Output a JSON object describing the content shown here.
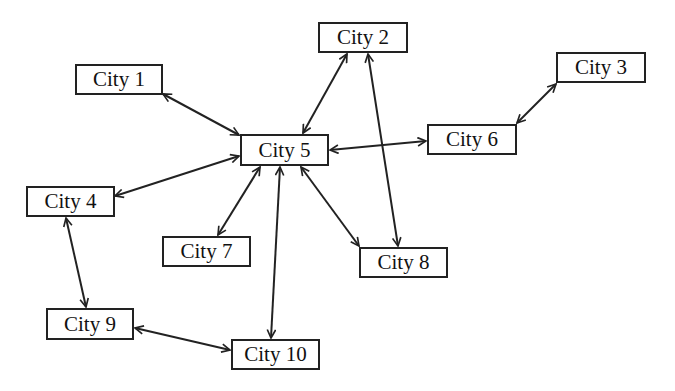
{
  "diagram": {
    "type": "network-graph",
    "nodes": [
      {
        "id": "c1",
        "label": "City 1",
        "x": 75,
        "y": 64,
        "w": 88,
        "h": 31
      },
      {
        "id": "c2",
        "label": "City 2",
        "x": 318,
        "y": 22,
        "w": 90,
        "h": 31
      },
      {
        "id": "c3",
        "label": "City 3",
        "x": 556,
        "y": 52,
        "w": 90,
        "h": 31
      },
      {
        "id": "c4",
        "label": "City 4",
        "x": 26,
        "y": 186,
        "w": 89,
        "h": 31
      },
      {
        "id": "c5",
        "label": "City 5",
        "x": 240,
        "y": 134,
        "w": 89,
        "h": 32
      },
      {
        "id": "c6",
        "label": "City 6",
        "x": 427,
        "y": 124,
        "w": 90,
        "h": 31
      },
      {
        "id": "c7",
        "label": "City 7",
        "x": 162,
        "y": 236,
        "w": 89,
        "h": 31
      },
      {
        "id": "c8",
        "label": "City 8",
        "x": 359,
        "y": 247,
        "w": 89,
        "h": 31
      },
      {
        "id": "c9",
        "label": "City 9",
        "x": 46,
        "y": 308,
        "w": 88,
        "h": 32
      },
      {
        "id": "c10",
        "label": "City 10",
        "x": 231,
        "y": 339,
        "w": 89,
        "h": 31
      }
    ],
    "edges": [
      {
        "from": "City 1",
        "to": "City 5",
        "x1": 163,
        "y1": 94,
        "x2": 239,
        "y2": 135,
        "bidirectional": true
      },
      {
        "from": "City 2",
        "to": "City 5",
        "x1": 347,
        "y1": 54,
        "x2": 303,
        "y2": 133,
        "bidirectional": true
      },
      {
        "from": "City 2",
        "to": "City 8",
        "x1": 368,
        "y1": 54,
        "x2": 398,
        "y2": 246,
        "bidirectional": true
      },
      {
        "from": "City 3",
        "to": "City 6",
        "x1": 556,
        "y1": 84,
        "x2": 517,
        "y2": 123,
        "bidirectional": true
      },
      {
        "from": "City 4",
        "to": "City 5",
        "x1": 115,
        "y1": 196,
        "x2": 239,
        "y2": 156,
        "bidirectional": true
      },
      {
        "from": "City 4",
        "to": "City 9",
        "x1": 66,
        "y1": 218,
        "x2": 86,
        "y2": 307,
        "bidirectional": true
      },
      {
        "from": "City 5",
        "to": "City 6",
        "x1": 330,
        "y1": 150,
        "x2": 426,
        "y2": 141,
        "bidirectional": true
      },
      {
        "from": "City 5",
        "to": "City 7",
        "x1": 260,
        "y1": 167,
        "x2": 218,
        "y2": 235,
        "bidirectional": true
      },
      {
        "from": "City 5",
        "to": "City 8",
        "x1": 301,
        "y1": 167,
        "x2": 359,
        "y2": 246,
        "bidirectional": true
      },
      {
        "from": "City 5",
        "to": "City 10",
        "x1": 280,
        "y1": 167,
        "x2": 271,
        "y2": 338,
        "bidirectional": true
      },
      {
        "from": "City 9",
        "to": "City 10",
        "x1": 135,
        "y1": 328,
        "x2": 230,
        "y2": 350,
        "bidirectional": true
      }
    ],
    "colors": {
      "stroke": "#222222",
      "text": "#111111",
      "background": "#ffffff"
    }
  }
}
